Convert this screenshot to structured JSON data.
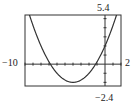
{
  "chart_data": {
    "type": "line",
    "title": "",
    "xlabel": "",
    "ylabel": "",
    "xlim": [
      -10,
      2
    ],
    "ylim": [
      -2.4,
      5.4
    ],
    "grid": false,
    "tick_labels": {
      "xmin": "−10",
      "xmax": "2",
      "ymin": "−2.4",
      "ymax": "5.4"
    },
    "x_ticks_every": 1,
    "y_ticks_every": 1,
    "series": [
      {
        "name": "parabola",
        "equation": "y = 0.25(x+4)^2 - 2",
        "x": [
          -10,
          -9,
          -8,
          -7,
          -6,
          -5,
          -4,
          -3,
          -2,
          -1,
          0,
          1,
          2
        ],
        "values": [
          7,
          4.25,
          2,
          0.25,
          -1,
          -1.75,
          -2,
          -1.75,
          -1,
          0.25,
          2,
          4.25,
          7
        ]
      }
    ]
  }
}
